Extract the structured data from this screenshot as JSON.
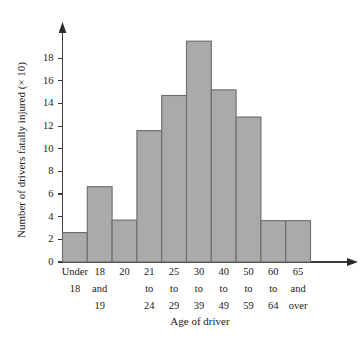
{
  "chart_data": {
    "type": "bar",
    "title": "",
    "subtitle": "",
    "xlabel": "Age of driver",
    "ylabel": "Number of drivers fatally injured (× 10)",
    "categories": [
      "Under 18",
      "18 and 19",
      "20",
      "21 to 24",
      "25 to 29",
      "30 to 39",
      "40 to 49",
      "50 to 59",
      "60 to 64",
      "65 and over"
    ],
    "category_lines": [
      [
        "Under",
        "18"
      ],
      [
        "18",
        "and",
        "19"
      ],
      [
        "20"
      ],
      [
        "21",
        "to",
        "24"
      ],
      [
        "25",
        "to",
        "29"
      ],
      [
        "30",
        "to",
        "39"
      ],
      [
        "40",
        "to",
        "49"
      ],
      [
        "50",
        "to",
        "59"
      ],
      [
        "60",
        "to",
        "64"
      ],
      [
        "65",
        "and",
        "over"
      ]
    ],
    "values": [
      2.6,
      6.65,
      3.7,
      11.6,
      14.7,
      19.5,
      15.2,
      12.8,
      3.65,
      3.65
    ],
    "ylim": [
      0,
      20
    ],
    "yticks": [
      0,
      2,
      4,
      6,
      8,
      10,
      12,
      14,
      16,
      18
    ],
    "ytick_labels": [
      "0",
      "2",
      "4",
      "6",
      "8",
      "10",
      "12",
      "14",
      "16",
      "18"
    ],
    "grid": false,
    "legend": false,
    "bar_fill_color": "#aaaaaa",
    "bar_edge_color": "#6b6b6b",
    "axis_color": "#3a3a3a"
  }
}
